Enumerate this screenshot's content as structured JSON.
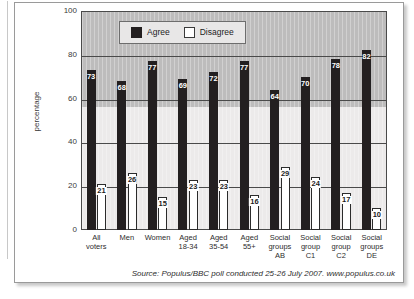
{
  "figure": {
    "cropped_title_fragment": "",
    "source_note": "Source: Populus/BBC poll conducted 25-26 July 2007. www.populus.co.uk"
  },
  "legend": {
    "items": [
      {
        "label": "Agree",
        "color": "#231f20",
        "style": "filled"
      },
      {
        "label": "Disagree",
        "color": "#ffffff",
        "style": "outlined"
      }
    ]
  },
  "axes": {
    "y_title": "percentage",
    "y_ticks": [
      "0",
      "20",
      "40",
      "60",
      "80",
      "100"
    ]
  },
  "chart_data": {
    "type": "bar",
    "title": "",
    "xlabel": "",
    "ylabel": "percentage",
    "ylim": [
      0,
      100
    ],
    "yticks": [
      0,
      20,
      40,
      60,
      80,
      100
    ],
    "grid": true,
    "legend_position": "top-left-inside",
    "categories": [
      "All voters",
      "Men",
      "Women",
      "Aged 18-34",
      "Aged 35-54",
      "Aged 55+",
      "Social groups AB",
      "Social group C1",
      "Social group C2",
      "Social groups DE"
    ],
    "category_lines": [
      [
        "All voters"
      ],
      [
        "Men"
      ],
      [
        "Women"
      ],
      [
        "Aged",
        "18-34"
      ],
      [
        "Aged",
        "35-54"
      ],
      [
        "Aged",
        "55+"
      ],
      [
        "Social",
        "groups",
        "AB"
      ],
      [
        "Social",
        "group",
        "C1"
      ],
      [
        "Social",
        "group",
        "C2"
      ],
      [
        "Social",
        "groups",
        "DE"
      ]
    ],
    "series": [
      {
        "name": "Agree",
        "color": "#231f20",
        "values": [
          73,
          68,
          77,
          69,
          72,
          77,
          64,
          70,
          78,
          82
        ]
      },
      {
        "name": "Disagree",
        "color": "#ffffff",
        "values": [
          21,
          26,
          15,
          23,
          23,
          16,
          29,
          24,
          17,
          10
        ]
      }
    ]
  }
}
